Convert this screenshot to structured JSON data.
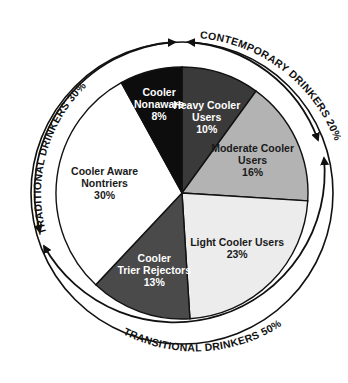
{
  "chart_data": {
    "type": "pie",
    "title": "",
    "start_angle_deg": 0,
    "direction": "clockwise",
    "slices": [
      {
        "label_lines": [
          "Heavy Cooler",
          "Users",
          "10%"
        ],
        "name": "Heavy Cooler Users",
        "value": 10,
        "color": "#3a3a3a",
        "text_color": "#ffffff"
      },
      {
        "label_lines": [
          "Moderate Cooler",
          "Users",
          "16%"
        ],
        "name": "Moderate Cooler Users",
        "value": 16,
        "color": "#b3b3b3",
        "text_color": "#1a1a1a"
      },
      {
        "label_lines": [
          "Light Cooler Users",
          "23%"
        ],
        "name": "Light Cooler Users",
        "value": 23,
        "color": "#ececec",
        "text_color": "#1a1a1a"
      },
      {
        "label_lines": [
          "Cooler",
          "Trier Rejectors",
          "13%"
        ],
        "name": "Cooler Trier Rejectors",
        "value": 13,
        "color": "#4a4a4a",
        "text_color": "#ffffff"
      },
      {
        "label_lines": [
          "Cooler Aware",
          "Nontriers",
          "30%"
        ],
        "name": "Cooler Aware Nontriers",
        "value": 30,
        "color": "#ffffff",
        "text_color": "#1a1a1a"
      },
      {
        "label_lines": [
          "Cooler",
          "Nonaware",
          "8%"
        ],
        "name": "Cooler Nonaware",
        "value": 8,
        "color": "#0d0d0d",
        "text_color": "#ffffff"
      }
    ],
    "groups": [
      {
        "label": "TRADITIONAL DRINKERS 30%",
        "value": 30,
        "includes": [
          "Cooler Aware Nontriers"
        ]
      },
      {
        "label": "CONTEMPORARY DRINKERS 20%",
        "value": 20,
        "includes": [
          "Heavy Cooler Users",
          "Cooler Nonaware"
        ]
      },
      {
        "label": "TRANSITIONAL DRINKERS 50%",
        "value": 50,
        "includes": [
          "Moderate Cooler Users",
          "Light Cooler Users",
          "Cooler Trier Rejectors"
        ]
      }
    ]
  },
  "labels": {
    "traditional": "TRADITIONAL DRINKERS 30%",
    "contemporary": "CONTEMPORARY DRINKERS 20%",
    "transitional": "TRANSITIONAL DRINKERS 50%"
  }
}
